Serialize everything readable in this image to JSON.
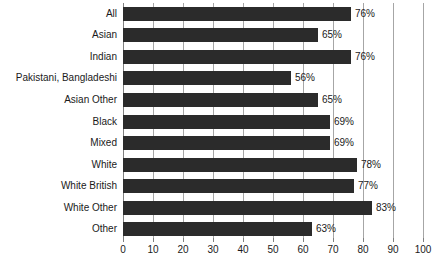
{
  "chart_data": {
    "type": "bar",
    "orientation": "horizontal",
    "title": "",
    "subtitle": "",
    "xlabel": "",
    "ylabel": "",
    "xlim": [
      0,
      100
    ],
    "xticks": [
      0,
      10,
      20,
      30,
      40,
      50,
      60,
      70,
      80,
      90,
      100
    ],
    "xtick_labels": [
      "0",
      "10",
      "20",
      "30",
      "40",
      "50",
      "60",
      "70",
      "80",
      "90",
      "100"
    ],
    "grid": true,
    "grid_axis": "x",
    "legend": false,
    "legend_position": "none",
    "value_label_suffix": "%",
    "categories": [
      "All",
      "Asian",
      "Indian",
      "Pakistani, Bangladeshi",
      "Asian Other",
      "Black",
      "Mixed",
      "White",
      "White British",
      "White Other",
      "Other"
    ],
    "values": [
      76,
      65,
      76,
      56,
      65,
      69,
      69,
      78,
      77,
      83,
      63
    ],
    "value_labels": [
      "76%",
      "65%",
      "76%",
      "56%",
      "65%",
      "69%",
      "69%",
      "78%",
      "77%",
      "83%",
      "63%"
    ],
    "colors": {
      "bar": "#2b2b2b",
      "gridline": "#a6a6a6",
      "axis": "#808080",
      "text": "#1a1a1a",
      "background": "#ffffff"
    }
  }
}
